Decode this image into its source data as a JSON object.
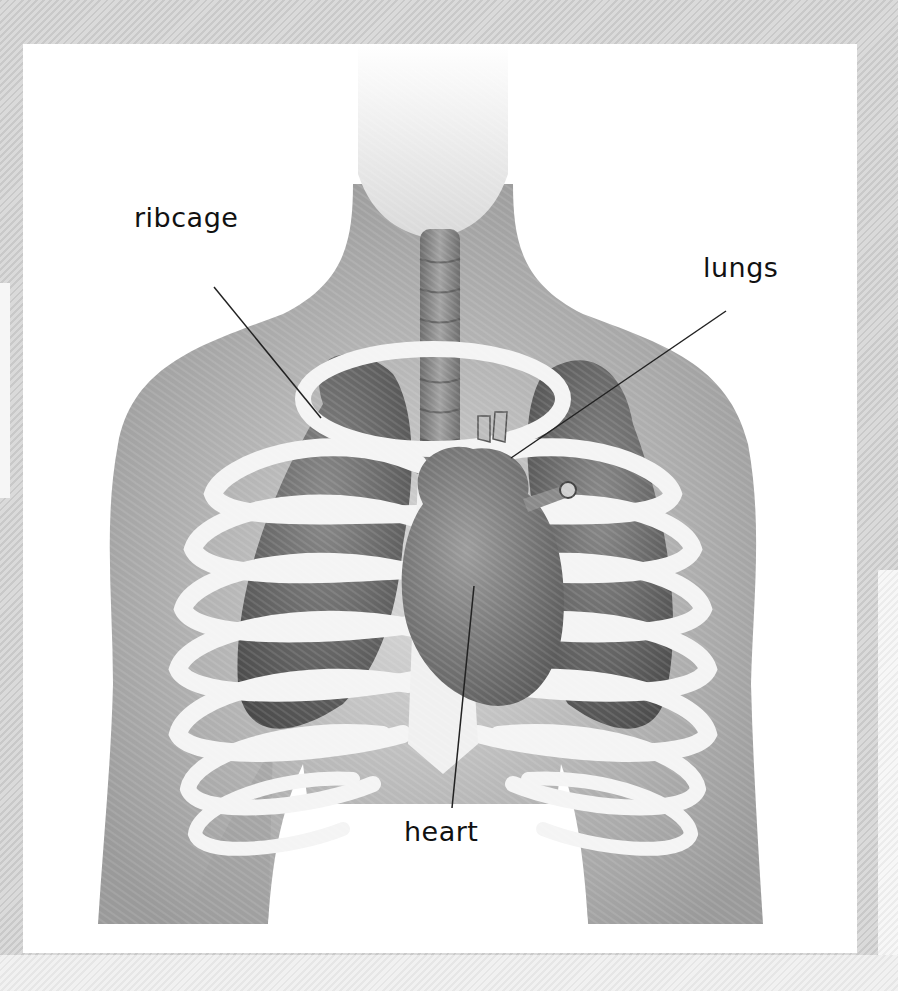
{
  "diagram": {
    "labels": [
      {
        "id": "ribcage",
        "text": "ribcage"
      },
      {
        "id": "lungs",
        "text": "lungs"
      },
      {
        "id": "heart",
        "text": "heart"
      }
    ],
    "colors": {
      "background_stripe": "#d2d2d2",
      "frame": "#ffffff",
      "body": "#a8a8a8",
      "head": "#f0f0f0",
      "ribs": "#f4f4f4",
      "lungs": "#5c5c5c",
      "heart": "#7a7a7a",
      "trachea": "#8a8a8a",
      "label_text": "#111111",
      "leader_line": "#222222"
    }
  }
}
